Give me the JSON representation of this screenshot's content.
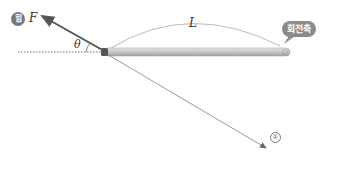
{
  "diagram": {
    "force_badge": "힘",
    "force_label": "F",
    "angle_label": "θ",
    "length_label": "L",
    "axis_label": "회전축",
    "line_marker": "①",
    "colors": {
      "force_arrow": "#555555",
      "ruler": "#bdbdbd",
      "bubble": "#8a8a8a"
    }
  }
}
